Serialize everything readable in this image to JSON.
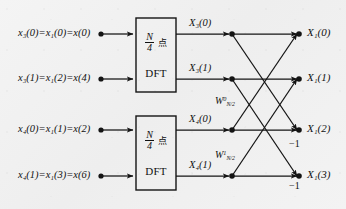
{
  "diagram": {
    "colors": {
      "ink": "#111111",
      "paper": "#f2f2f2"
    },
    "inputs": [
      {
        "name": "input-row-1",
        "text": "x₃(0)=x₁(0)=x(0)"
      },
      {
        "name": "input-row-2",
        "text": "x₃(1)=x₁(2)=x(4)"
      },
      {
        "name": "input-row-3",
        "text": "x₄(0)=x₁(1)=x(2)"
      },
      {
        "name": "input-row-4",
        "text": "x₄(1)=x₁(3)=x(6)"
      }
    ],
    "blocks": [
      {
        "name": "dft-block-top",
        "numerator": "N",
        "denominator": "4",
        "unit": "点",
        "label": "DFT"
      },
      {
        "name": "dft-block-bottom",
        "numerator": "N",
        "denominator": "4",
        "unit": "点",
        "label": "DFT"
      }
    ],
    "intermediates": [
      {
        "name": "node-label-X3-0",
        "text": "X₃(0)"
      },
      {
        "name": "node-label-X3-1",
        "text": "X₃(1)"
      },
      {
        "name": "node-label-X4-0",
        "text": "X₄(0)"
      },
      {
        "name": "node-label-X4-1",
        "text": "X₄(1)"
      }
    ],
    "twiddles": [
      {
        "name": "twiddle-w0",
        "base": "W",
        "sup": "0",
        "sub": "N/2"
      },
      {
        "name": "twiddle-w1",
        "base": "W",
        "sup": "1",
        "sub": "N/2"
      }
    ],
    "gains": [
      {
        "name": "gain-minus-one-upper",
        "text": "−1"
      },
      {
        "name": "gain-minus-one-lower",
        "text": "−1"
      }
    ],
    "outputs": [
      {
        "name": "output-X1-0",
        "text": "X₁(0)"
      },
      {
        "name": "output-X1-1",
        "text": "X₁(1)"
      },
      {
        "name": "output-X1-2",
        "text": "X₁(2)"
      },
      {
        "name": "output-X1-3",
        "text": "X₁(3)"
      }
    ]
  }
}
